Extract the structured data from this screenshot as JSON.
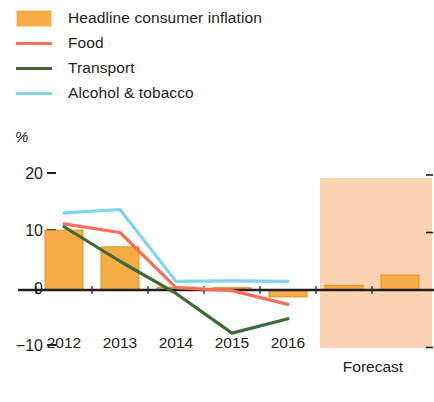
{
  "legend": {
    "items": [
      {
        "label": "Headline consumer inflation",
        "marker": "box",
        "color": "#f6ad46",
        "name": "legend-item-headline-consumer-inflation"
      },
      {
        "label": "Food",
        "marker": "line",
        "color": "#f4705a",
        "name": "legend-item-food"
      },
      {
        "label": "Transport",
        "marker": "line",
        "color": "#3d6b38",
        "name": "legend-item-transport"
      },
      {
        "label": "Alcohol & tobacco",
        "marker": "line",
        "color": "#7fd4ee",
        "name": "legend-item-alcohol-tobacco"
      }
    ]
  },
  "axis": {
    "unit": "%",
    "y_ticks": [
      "20",
      "10",
      "0",
      "−10"
    ],
    "x_ticks": [
      "2012",
      "2013",
      "2014",
      "2015",
      "2016",
      "2017",
      "2018"
    ],
    "forecast_caption": "Forecast"
  },
  "chart_data": {
    "type": "bar",
    "title": "",
    "subtitle": "",
    "xlabel": "",
    "ylabel": "%",
    "ylim": [
      -12,
      22
    ],
    "yticks": [
      20,
      10,
      0,
      -10
    ],
    "grid": false,
    "legend_position": "top-left",
    "categories": [
      "2012",
      "2013",
      "2014",
      "2015",
      "2016",
      "2017",
      "2018"
    ],
    "bars": {
      "name": "Headline consumer inflation",
      "color": "#f6ad46",
      "values": [
        10.4,
        7.5,
        0.5,
        0.4,
        -1.2,
        0.8,
        2.6
      ]
    },
    "series": [
      {
        "name": "Food",
        "color": "#f4705a",
        "values": [
          11.5,
          10.0,
          0.4,
          -0.1,
          -2.5,
          null,
          null
        ]
      },
      {
        "name": "Transport",
        "color": "#3d6b38",
        "values": [
          11.0,
          5.0,
          -0.6,
          -7.5,
          -5.0,
          null,
          null
        ]
      },
      {
        "name": "Alcohol & tobacco",
        "color": "#7fd4ee",
        "values": [
          13.4,
          14.0,
          1.5,
          1.6,
          1.5,
          null,
          null
        ]
      }
    ],
    "annotations": [
      {
        "text": "Forecast",
        "type": "shaded-region",
        "from": "2017",
        "to": "2018",
        "color": "#f9d3b2"
      }
    ]
  },
  "colors": {
    "bar": "#f6ad46",
    "bar_edge": "#e08d1e",
    "food": "#f4705a",
    "transport": "#3d6b38",
    "alcohol": "#7fd4ee",
    "forecast_band": "#f9d3b2",
    "axis": "#231f20"
  }
}
